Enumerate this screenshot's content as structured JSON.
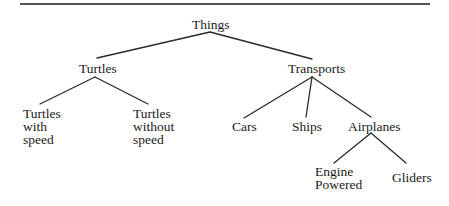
{
  "diagram": {
    "type": "tree",
    "root": "Things",
    "nodes": {
      "things": {
        "label": "Things"
      },
      "turtles": {
        "label": "Turtles"
      },
      "transports": {
        "label": "Transports"
      },
      "turtles_with_speed": {
        "lines": [
          "Turtles",
          "with",
          "speed"
        ]
      },
      "turtles_without_speed": {
        "lines": [
          "Turtles",
          "without",
          "speed"
        ]
      },
      "cars": {
        "label": "Cars"
      },
      "ships": {
        "label": "Ships"
      },
      "airplanes": {
        "label": "Airplanes"
      },
      "engine_powered": {
        "lines": [
          "Engine",
          "Powered"
        ]
      },
      "gliders": {
        "label": "Gliders"
      }
    },
    "edges": [
      {
        "from": "Things",
        "to": "Turtles"
      },
      {
        "from": "Things",
        "to": "Transports"
      },
      {
        "from": "Turtles",
        "to": "Turtles with speed"
      },
      {
        "from": "Turtles",
        "to": "Turtles without speed"
      },
      {
        "from": "Transports",
        "to": "Cars"
      },
      {
        "from": "Transports",
        "to": "Ships"
      },
      {
        "from": "Transports",
        "to": "Airplanes"
      },
      {
        "from": "Airplanes",
        "to": "Engine Powered"
      },
      {
        "from": "Airplanes",
        "to": "Gliders"
      }
    ]
  }
}
